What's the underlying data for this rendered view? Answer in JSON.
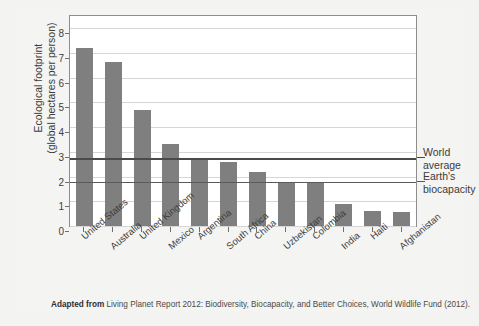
{
  "figure": {
    "title_partial": "",
    "caption_bold": "Adapted from",
    "caption_rest": "Living Planet Report 2012: Biodiversity, Biocapacity, and Better Choices, World Wildlife Fund (2012)."
  },
  "chart_data": {
    "type": "bar",
    "title": "",
    "xlabel": "",
    "ylabel": "Ecological footprint (global hectares per person)",
    "ylabel_line1": "Ecological footprint",
    "ylabel_line2": "(global hectares per person)",
    "ylim": [
      0,
      8.5
    ],
    "yticks": [
      0,
      1,
      2,
      3,
      4,
      5,
      6,
      7,
      8
    ],
    "ytick_labels": [
      "0",
      "1",
      "2",
      "3",
      "4",
      "5",
      "6",
      "7",
      "8"
    ],
    "grid": true,
    "legend": "none",
    "bar_color": "#7f7f7f",
    "categories": [
      "United States",
      "Australia",
      "United Kingdom",
      "Mexico",
      "Argentina",
      "South Africa",
      "China",
      "Uzbekistan",
      "Colombia",
      "India",
      "Haiti",
      "Afghanistan"
    ],
    "values": [
      7.2,
      6.65,
      4.7,
      3.3,
      2.75,
      2.6,
      2.2,
      1.75,
      1.75,
      0.9,
      0.6,
      0.55
    ],
    "reference_lines": [
      {
        "label": "World\naverage",
        "label_line1": "World",
        "label_line2": "average",
        "value": 2.75,
        "color": "#4a4a4a"
      },
      {
        "label": "Earth's\nbiocapacity",
        "label_line1": "Earth's",
        "label_line2": "biocapacity",
        "value": 1.78,
        "color": "#5a5a5a"
      }
    ]
  }
}
